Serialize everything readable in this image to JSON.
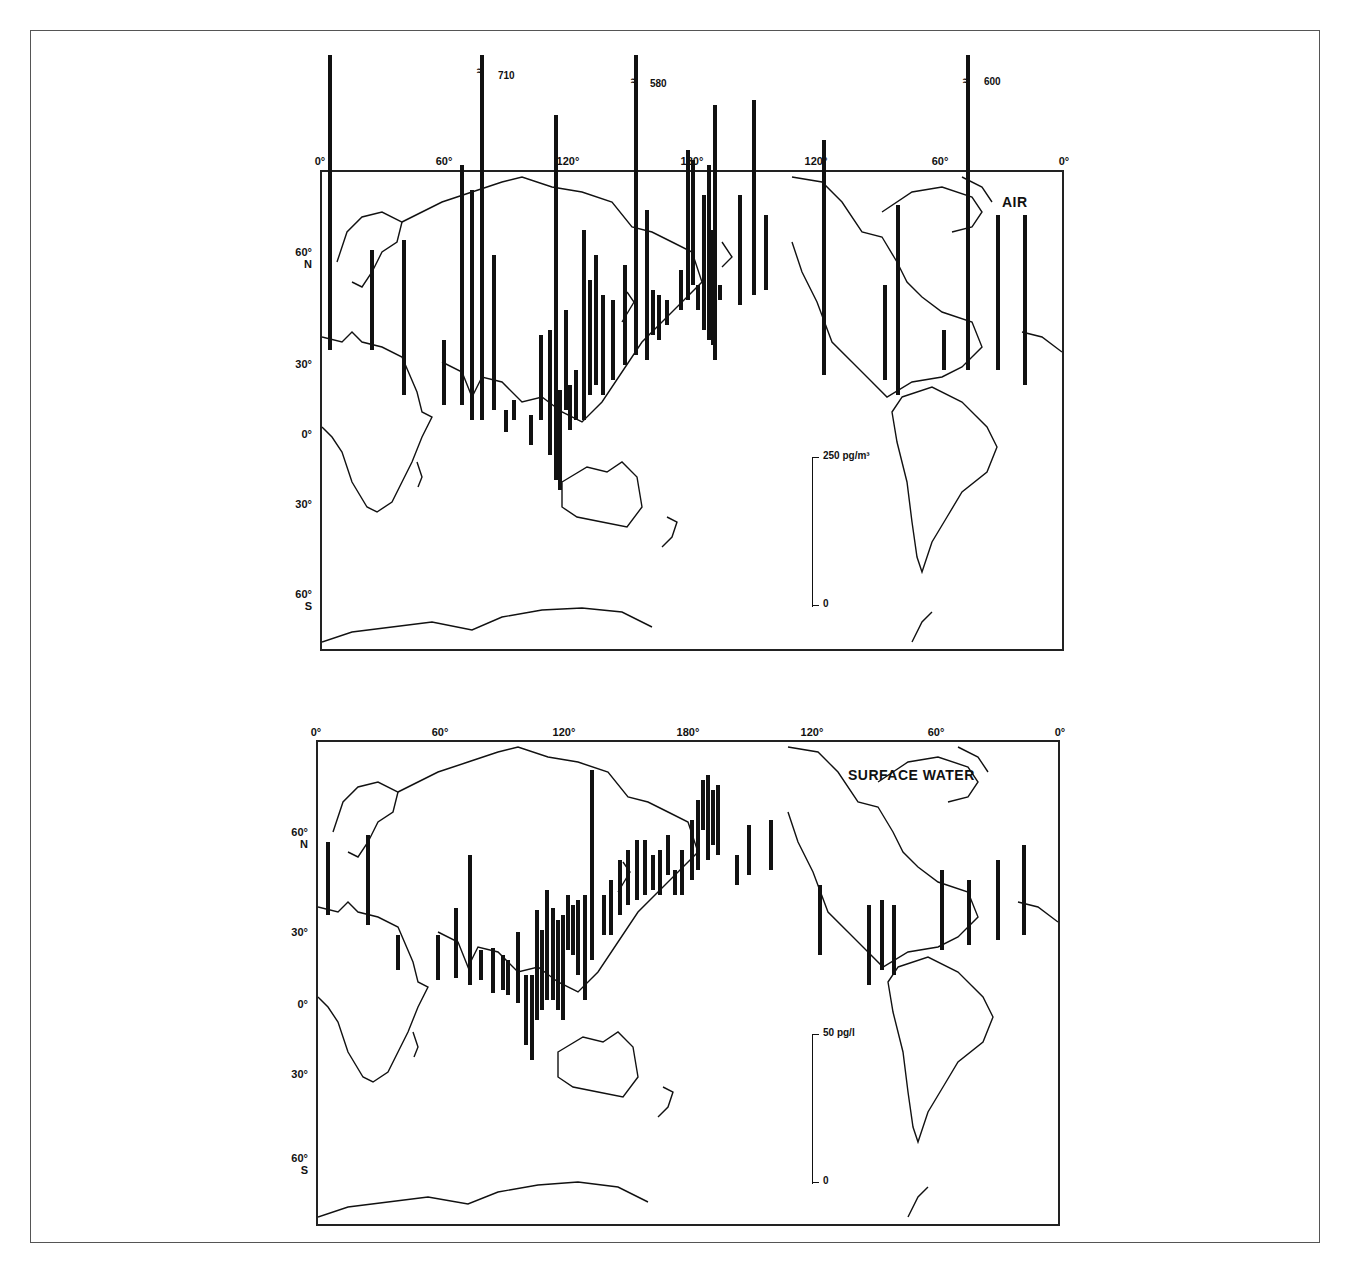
{
  "figure": {
    "panels": [
      {
        "id": "air",
        "title": "AIR",
        "lon_labels": [
          "0°",
          "60°",
          "120°",
          "180°",
          "120°",
          "60°",
          "0°"
        ],
        "lat_labels": [
          {
            "deg": "60°",
            "hem": "N"
          },
          {
            "deg": "30°",
            "hem": ""
          },
          {
            "deg": "0°",
            "hem": ""
          },
          {
            "deg": "30°",
            "hem": ""
          },
          {
            "deg": "60°",
            "hem": "S"
          }
        ],
        "scale": {
          "top_label": "250 pg/m³",
          "bottom_label": "0"
        },
        "offscale_values": [
          "710",
          "580",
          "600"
        ]
      },
      {
        "id": "surface_water",
        "title": "SURFACE WATER",
        "lon_labels": [
          "0°",
          "60°",
          "120°",
          "180°",
          "120°",
          "60°",
          "0°"
        ],
        "lat_labels": [
          {
            "deg": "60°",
            "hem": "N"
          },
          {
            "deg": "30°",
            "hem": ""
          },
          {
            "deg": "0°",
            "hem": ""
          },
          {
            "deg": "30°",
            "hem": ""
          },
          {
            "deg": "60°",
            "hem": "S"
          }
        ],
        "scale": {
          "top_label": "50 pg/l",
          "bottom_label": "0"
        }
      }
    ]
  },
  "chart_data": [
    {
      "type": "map-bar",
      "title": "AIR",
      "unit": "pg/m³",
      "scale_bar_max": 250,
      "offscale_labels": [
        710,
        580,
        600
      ],
      "bars_px": [
        [
          330,
          55,
          350
        ],
        [
          372,
          250,
          350
        ],
        [
          404,
          240,
          395
        ],
        [
          444,
          340,
          405
        ],
        [
          462,
          165,
          405
        ],
        [
          472,
          190,
          420
        ],
        [
          482,
          55,
          420
        ],
        [
          494,
          255,
          410
        ],
        [
          506,
          410,
          432
        ],
        [
          514,
          400,
          420
        ],
        [
          531,
          415,
          445
        ],
        [
          541,
          335,
          420
        ],
        [
          550,
          330,
          455
        ],
        [
          556,
          115,
          480
        ],
        [
          560,
          390,
          490
        ],
        [
          566,
          310,
          410
        ],
        [
          570,
          385,
          430
        ],
        [
          576,
          370,
          420
        ],
        [
          584,
          230,
          420
        ],
        [
          590,
          280,
          395
        ],
        [
          596,
          255,
          385
        ],
        [
          603,
          295,
          395
        ],
        [
          613,
          300,
          380
        ],
        [
          625,
          265,
          365
        ],
        [
          636,
          55,
          355
        ],
        [
          647,
          210,
          360
        ],
        [
          653,
          290,
          335
        ],
        [
          659,
          295,
          340
        ],
        [
          667,
          300,
          325
        ],
        [
          681,
          270,
          310
        ],
        [
          688,
          150,
          300
        ],
        [
          693,
          160,
          285
        ],
        [
          698,
          285,
          310
        ],
        [
          704,
          195,
          330
        ],
        [
          709,
          165,
          340
        ],
        [
          713,
          230,
          345
        ],
        [
          715,
          105,
          360
        ],
        [
          720,
          285,
          300
        ],
        [
          740,
          195,
          305
        ],
        [
          754,
          100,
          295
        ],
        [
          766,
          215,
          290
        ],
        [
          824,
          140,
          375
        ],
        [
          885,
          285,
          380
        ],
        [
          898,
          205,
          395
        ],
        [
          944,
          330,
          370
        ],
        [
          968,
          55,
          370
        ],
        [
          998,
          215,
          370
        ],
        [
          1025,
          215,
          385
        ]
      ],
      "plot_box_px": {
        "x0": 320,
        "y0": 170,
        "x1": 1063,
        "y1": 650
      }
    },
    {
      "type": "map-bar",
      "title": "SURFACE WATER",
      "unit": "pg/l",
      "scale_bar_max": 50,
      "bars_px": [
        [
          328,
          842,
          915
        ],
        [
          368,
          835,
          925
        ],
        [
          398,
          935,
          970
        ],
        [
          438,
          935,
          980
        ],
        [
          456,
          908,
          978
        ],
        [
          470,
          855,
          985
        ],
        [
          481,
          950,
          980
        ],
        [
          493,
          948,
          993
        ],
        [
          503,
          955,
          990
        ],
        [
          508,
          960,
          995
        ],
        [
          518,
          932,
          1003
        ],
        [
          526,
          975,
          1045
        ],
        [
          532,
          975,
          1060
        ],
        [
          537,
          910,
          1020
        ],
        [
          542,
          930,
          1010
        ],
        [
          547,
          890,
          1000
        ],
        [
          553,
          908,
          1000
        ],
        [
          558,
          920,
          1010
        ],
        [
          563,
          915,
          1020
        ],
        [
          568,
          895,
          950
        ],
        [
          573,
          905,
          955
        ],
        [
          578,
          900,
          975
        ],
        [
          585,
          895,
          1000
        ],
        [
          592,
          770,
          960
        ],
        [
          604,
          895,
          935
        ],
        [
          611,
          880,
          935
        ],
        [
          620,
          860,
          915
        ],
        [
          628,
          850,
          905
        ],
        [
          637,
          840,
          900
        ],
        [
          645,
          840,
          895
        ],
        [
          653,
          855,
          890
        ],
        [
          660,
          850,
          895
        ],
        [
          668,
          835,
          875
        ],
        [
          675,
          870,
          895
        ],
        [
          682,
          850,
          895
        ],
        [
          692,
          820,
          880
        ],
        [
          698,
          800,
          870
        ],
        [
          703,
          780,
          830
        ],
        [
          708,
          775,
          860
        ],
        [
          713,
          790,
          845
        ],
        [
          718,
          785,
          855
        ],
        [
          737,
          855,
          885
        ],
        [
          749,
          825,
          875
        ],
        [
          771,
          820,
          870
        ],
        [
          820,
          885,
          955
        ],
        [
          869,
          905,
          985
        ],
        [
          882,
          900,
          970
        ],
        [
          894,
          905,
          975
        ],
        [
          942,
          870,
          950
        ],
        [
          969,
          880,
          945
        ],
        [
          998,
          860,
          940
        ],
        [
          1024,
          845,
          935
        ]
      ],
      "plot_box_px": {
        "x0": 316,
        "y0": 740,
        "x1": 1059,
        "y1": 1225
      }
    }
  ]
}
